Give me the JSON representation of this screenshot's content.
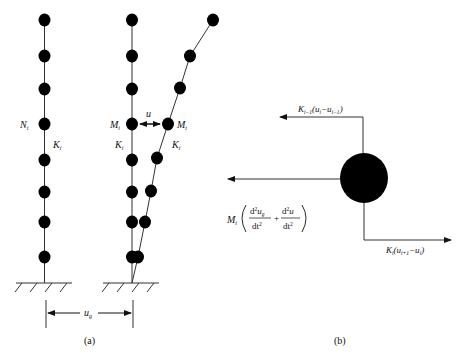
{
  "panel_a": {
    "caption": "(a)",
    "left_column": {
      "mass_label": "N",
      "mass_sub": "i",
      "stiffness_label": "K",
      "stiffness_sub": "i",
      "node_ys": [
        20,
        56,
        89,
        124,
        160,
        192,
        222,
        257
      ]
    },
    "right_column": {
      "mass_label_undeformed": "M",
      "mass_label_deformed": "M",
      "mass_sub": "i",
      "stiffness_label_undeformed": "K",
      "stiffness_label_deformed": "K",
      "stiffness_sub": "i",
      "relative_displacement_label": "u",
      "deformed_nodes": [
        [
          213,
          20
        ],
        [
          190,
          56
        ],
        [
          180,
          88
        ],
        [
          168,
          124
        ],
        [
          157,
          158
        ],
        [
          151,
          191
        ],
        [
          145,
          222
        ],
        [
          138,
          257
        ]
      ]
    },
    "ground_displacement_label": "u",
    "ground_displacement_sub": "g"
  },
  "panel_b": {
    "caption": "(b)",
    "top_force": {
      "K": "K",
      "K_sub": "i−1",
      "expr_open": "(u",
      "u1_sub": "i",
      "minus": "−u",
      "u2_sub": "i−1",
      "close": ")"
    },
    "bottom_force": {
      "K": "K",
      "K_sub": "i",
      "expr_open": "(u",
      "u1_sub": "i+1",
      "minus": "−u",
      "u2_sub": "i",
      "close": ")"
    },
    "inertia_force": {
      "M": "M",
      "M_sub": "i",
      "num1": "d",
      "num1_sup": "2",
      "num1_var": "u",
      "num1_var_sub": "g",
      "den1": "dt",
      "den1_sup": "2",
      "plus": "+",
      "num2": "d",
      "num2_sup": "2",
      "num2_var": "u",
      "den2": "dt",
      "den2_sup": "2"
    }
  },
  "colors": {
    "ink": "#111111",
    "line": "#333333",
    "background": "#ffffff"
  }
}
